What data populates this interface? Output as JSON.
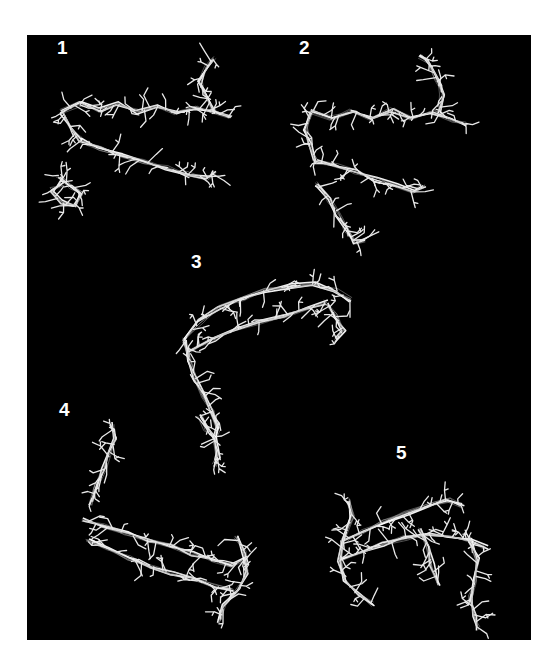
{
  "figure": {
    "background": "#ffffff",
    "panel": {
      "x": 27,
      "y": 35,
      "width": 504,
      "height": 605,
      "color": "#000000"
    },
    "stroke_color": "#e8e8e8",
    "panels": [
      {
        "label": "1",
        "label_pos": [
          57,
          54
        ],
        "backbones": [
          [
            [
              62,
              112
            ],
            [
              80,
              104
            ],
            [
              100,
              110
            ],
            [
              118,
              104
            ],
            [
              138,
              112
            ],
            [
              156,
              106
            ],
            [
              176,
              114
            ],
            [
              196,
              108
            ],
            [
              214,
              112
            ],
            [
              230,
              118
            ]
          ],
          [
            [
              80,
              140
            ],
            [
              100,
              148
            ],
            [
              122,
              156
            ],
            [
              144,
              162
            ],
            [
              166,
              168
            ],
            [
              188,
              174
            ],
            [
              208,
              178
            ],
            [
              214,
              172
            ]
          ],
          [
            [
              58,
              175
            ],
            [
              70,
              186
            ],
            [
              82,
              194
            ],
            [
              74,
              206
            ],
            [
              60,
              202
            ],
            [
              52,
              190
            ],
            [
              62,
              184
            ]
          ],
          [
            [
              214,
              112
            ],
            [
              206,
              96
            ],
            [
              200,
              82
            ],
            [
              206,
              68
            ],
            [
              214,
              58
            ]
          ],
          [
            [
              62,
              112
            ],
            [
              70,
              126
            ],
            [
              80,
              140
            ]
          ]
        ],
        "seed": 11
      },
      {
        "label": "2",
        "label_pos": [
          299,
          54
        ],
        "backbones": [
          [
            [
              312,
              112
            ],
            [
              332,
              118
            ],
            [
              352,
              110
            ],
            [
              372,
              118
            ],
            [
              392,
              110
            ],
            [
              412,
              118
            ],
            [
              432,
              112
            ],
            [
              452,
              120
            ],
            [
              468,
              124
            ]
          ],
          [
            [
              316,
              162
            ],
            [
              336,
              166
            ],
            [
              356,
              172
            ],
            [
              376,
              180
            ],
            [
              396,
              186
            ],
            [
              414,
              192
            ],
            [
              424,
              186
            ]
          ],
          [
            [
              312,
              112
            ],
            [
              306,
              128
            ],
            [
              310,
              144
            ],
            [
              316,
              162
            ]
          ],
          [
            [
              440,
              112
            ],
            [
              442,
              94
            ],
            [
              436,
              78
            ],
            [
              428,
              62
            ],
            [
              420,
              56
            ]
          ],
          [
            [
              318,
              184
            ],
            [
              330,
              200
            ],
            [
              338,
              214
            ],
            [
              346,
              228
            ],
            [
              354,
              242
            ],
            [
              364,
              240
            ]
          ]
        ],
        "seed": 23
      },
      {
        "label": "3",
        "label_pos": [
          191,
          268
        ],
        "backbones": [
          [
            [
              184,
              340
            ],
            [
              200,
              322
            ],
            [
              220,
              308
            ],
            [
              242,
              298
            ],
            [
              266,
              290
            ],
            [
              290,
              286
            ],
            [
              314,
              284
            ],
            [
              336,
              290
            ],
            [
              350,
              300
            ]
          ],
          [
            [
              190,
              350
            ],
            [
              212,
              340
            ],
            [
              236,
              330
            ],
            [
              260,
              322
            ],
            [
              284,
              316
            ],
            [
              306,
              308
            ],
            [
              326,
              302
            ]
          ],
          [
            [
              184,
              340
            ],
            [
              190,
              360
            ],
            [
              196,
              380
            ],
            [
              204,
              396
            ],
            [
              212,
              412
            ],
            [
              218,
              428
            ],
            [
              214,
              442
            ]
          ],
          [
            [
              326,
              302
            ],
            [
              336,
              316
            ],
            [
              344,
              330
            ],
            [
              336,
              340
            ]
          ]
        ],
        "seed": 37
      },
      {
        "label": "4",
        "label_pos": [
          59,
          416
        ],
        "backbones": [
          [
            [
              84,
              520
            ],
            [
              104,
              526
            ],
            [
              126,
              534
            ],
            [
              148,
              540
            ],
            [
              170,
              546
            ],
            [
              192,
              554
            ],
            [
              212,
              560
            ],
            [
              232,
              566
            ],
            [
              246,
              558
            ]
          ],
          [
            [
              88,
              540
            ],
            [
              108,
              548
            ],
            [
              130,
              558
            ],
            [
              152,
              566
            ],
            [
              172,
              574
            ],
            [
              194,
              580
            ],
            [
              214,
              586
            ],
            [
              232,
              590
            ]
          ],
          [
            [
              90,
              504
            ],
            [
              96,
              486
            ],
            [
              104,
              470
            ],
            [
              110,
              454
            ],
            [
              116,
              440
            ],
            [
              112,
              424
            ]
          ],
          [
            [
              236,
              536
            ],
            [
              244,
              552
            ],
            [
              246,
              572
            ],
            [
              238,
              590
            ],
            [
              224,
              606
            ],
            [
              220,
              622
            ]
          ],
          [
            [
              200,
              416
            ],
            [
              206,
              428
            ],
            [
              214,
              438
            ],
            [
              218,
              456
            ],
            [
              214,
              466
            ]
          ]
        ],
        "seed": 53
      },
      {
        "label": "5",
        "label_pos": [
          396,
          459
        ],
        "backbones": [
          [
            [
              344,
              540
            ],
            [
              364,
              532
            ],
            [
              384,
              522
            ],
            [
              406,
              514
            ],
            [
              428,
              506
            ],
            [
              448,
              500
            ],
            [
              462,
              506
            ]
          ],
          [
            [
              340,
              560
            ],
            [
              362,
              552
            ],
            [
              384,
              544
            ],
            [
              406,
              538
            ],
            [
              428,
              534
            ],
            [
              450,
              536
            ],
            [
              470,
              540
            ],
            [
              486,
              548
            ]
          ],
          [
            [
              348,
              500
            ],
            [
              352,
              516
            ],
            [
              344,
              540
            ],
            [
              340,
              560
            ],
            [
              344,
              580
            ],
            [
              356,
              594
            ],
            [
              372,
              604
            ]
          ],
          [
            [
              470,
              540
            ],
            [
              478,
              560
            ],
            [
              476,
              580
            ],
            [
              470,
              598
            ],
            [
              474,
              614
            ],
            [
              478,
              628
            ]
          ],
          [
            [
              420,
              530
            ],
            [
              428,
              548
            ],
            [
              432,
              566
            ],
            [
              438,
              584
            ]
          ]
        ],
        "seed": 71
      }
    ]
  }
}
